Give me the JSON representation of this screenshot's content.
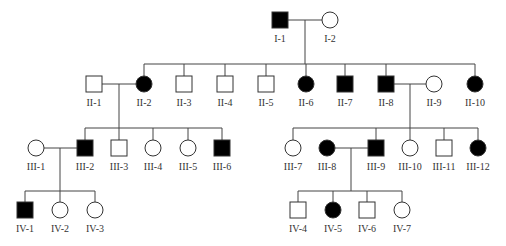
{
  "colors": {
    "affected": "#000000",
    "unaffected": "#ffffff",
    "line": "#444444"
  },
  "individuals": [
    {
      "id": "I-1",
      "sex": "male",
      "affected": true,
      "x": 280,
      "y": 20
    },
    {
      "id": "I-2",
      "sex": "female",
      "affected": false,
      "x": 330,
      "y": 20
    },
    {
      "id": "II-1",
      "sex": "male",
      "affected": false,
      "x": 94,
      "y": 84
    },
    {
      "id": "II-2",
      "sex": "female",
      "affected": true,
      "x": 144,
      "y": 84
    },
    {
      "id": "II-3",
      "sex": "male",
      "affected": false,
      "x": 184,
      "y": 84
    },
    {
      "id": "II-4",
      "sex": "male",
      "affected": false,
      "x": 225,
      "y": 84
    },
    {
      "id": "II-5",
      "sex": "male",
      "affected": false,
      "x": 266,
      "y": 84
    },
    {
      "id": "II-6",
      "sex": "female",
      "affected": true,
      "x": 306,
      "y": 84
    },
    {
      "id": "II-7",
      "sex": "male",
      "affected": true,
      "x": 345,
      "y": 84
    },
    {
      "id": "II-8",
      "sex": "male",
      "affected": true,
      "x": 386,
      "y": 84
    },
    {
      "id": "II-9",
      "sex": "female",
      "affected": false,
      "x": 434,
      "y": 84
    },
    {
      "id": "II-10",
      "sex": "female",
      "affected": true,
      "x": 475,
      "y": 84
    },
    {
      "id": "III-1",
      "sex": "female",
      "affected": false,
      "x": 36,
      "y": 148
    },
    {
      "id": "III-2",
      "sex": "male",
      "affected": true,
      "x": 85,
      "y": 148
    },
    {
      "id": "III-3",
      "sex": "male",
      "affected": false,
      "x": 119,
      "y": 148
    },
    {
      "id": "III-4",
      "sex": "female",
      "affected": false,
      "x": 153,
      "y": 148
    },
    {
      "id": "III-5",
      "sex": "female",
      "affected": false,
      "x": 188,
      "y": 148
    },
    {
      "id": "III-6",
      "sex": "male",
      "affected": true,
      "x": 222,
      "y": 148
    },
    {
      "id": "III-7",
      "sex": "female",
      "affected": false,
      "x": 293,
      "y": 148
    },
    {
      "id": "III-8",
      "sex": "female",
      "affected": true,
      "x": 327,
      "y": 148
    },
    {
      "id": "III-9",
      "sex": "male",
      "affected": true,
      "x": 376,
      "y": 148
    },
    {
      "id": "III-10",
      "sex": "female",
      "affected": false,
      "x": 410,
      "y": 148
    },
    {
      "id": "III-11",
      "sex": "male",
      "affected": false,
      "x": 444,
      "y": 148
    },
    {
      "id": "III-12",
      "sex": "female",
      "affected": true,
      "x": 478,
      "y": 148
    },
    {
      "id": "IV-1",
      "sex": "male",
      "affected": true,
      "x": 25,
      "y": 210
    },
    {
      "id": "IV-2",
      "sex": "female",
      "affected": false,
      "x": 60,
      "y": 210
    },
    {
      "id": "IV-3",
      "sex": "female",
      "affected": false,
      "x": 95,
      "y": 210
    },
    {
      "id": "IV-4",
      "sex": "male",
      "affected": false,
      "x": 298,
      "y": 210
    },
    {
      "id": "IV-5",
      "sex": "female",
      "affected": true,
      "x": 333,
      "y": 210
    },
    {
      "id": "IV-6",
      "sex": "male",
      "affected": false,
      "x": 367,
      "y": 210
    },
    {
      "id": "IV-7",
      "sex": "female",
      "affected": false,
      "x": 402,
      "y": 210
    }
  ],
  "lines": [
    [
      288,
      20,
      322,
      20
    ],
    [
      305,
      20,
      305,
      64
    ],
    [
      144,
      64,
      475,
      64
    ],
    [
      144,
      64,
      144,
      76
    ],
    [
      184,
      64,
      184,
      76
    ],
    [
      225,
      64,
      225,
      76
    ],
    [
      266,
      64,
      266,
      76
    ],
    [
      306,
      64,
      306,
      76
    ],
    [
      345,
      64,
      345,
      76
    ],
    [
      386,
      64,
      386,
      76
    ],
    [
      475,
      64,
      475,
      76
    ],
    [
      102,
      84,
      136,
      84
    ],
    [
      394,
      84,
      426,
      84
    ],
    [
      119,
      84,
      119,
      128
    ],
    [
      85,
      128,
      222,
      128
    ],
    [
      85,
      128,
      85,
      140
    ],
    [
      119,
      128,
      119,
      140
    ],
    [
      153,
      128,
      153,
      140
    ],
    [
      188,
      128,
      188,
      140
    ],
    [
      222,
      128,
      222,
      140
    ],
    [
      410,
      84,
      410,
      128
    ],
    [
      293,
      128,
      478,
      128
    ],
    [
      293,
      128,
      293,
      140
    ],
    [
      376,
      128,
      376,
      140
    ],
    [
      410,
      128,
      410,
      140
    ],
    [
      444,
      128,
      444,
      140
    ],
    [
      478,
      128,
      478,
      140
    ],
    [
      44,
      148,
      77,
      148
    ],
    [
      60,
      148,
      60,
      191
    ],
    [
      25,
      191,
      95,
      191
    ],
    [
      25,
      191,
      25,
      202
    ],
    [
      60,
      191,
      60,
      202
    ],
    [
      95,
      191,
      95,
      202
    ],
    [
      335,
      148,
      368,
      148
    ],
    [
      351,
      148,
      351,
      191
    ],
    [
      298,
      191,
      402,
      191
    ],
    [
      298,
      191,
      298,
      202
    ],
    [
      333,
      191,
      333,
      202
    ],
    [
      367,
      191,
      367,
      202
    ],
    [
      402,
      191,
      402,
      202
    ]
  ]
}
